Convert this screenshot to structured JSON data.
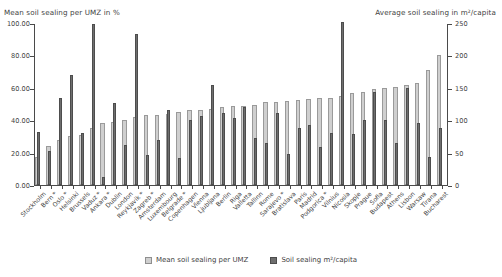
{
  "chart_data": {
    "type": "bar",
    "title": "",
    "left_axis": {
      "label": "Mean soil sealing per UMZ in %",
      "ticks": [
        "0.00",
        "20.00",
        "40.00",
        "60.00",
        "80.00",
        "100.00"
      ],
      "min": 0,
      "max": 100,
      "grid": false
    },
    "right_axis": {
      "label": "Average soil sealing in m²/capita",
      "ticks": [
        "0",
        "50",
        "100",
        "150",
        "200",
        "250"
      ],
      "min": 0,
      "max": 250,
      "grid": false
    },
    "legend": {
      "position": "bottom-center",
      "entries": [
        {
          "name": "Mean soil sealing per UMZ",
          "color": "#cfcfcf"
        },
        {
          "name": "Soil sealing m²/capita",
          "color": "#6e6e6e"
        }
      ]
    },
    "categories": [
      "Stockholm",
      "Bern *",
      "Oslo *",
      "Helsinki",
      "Brussels",
      "Vaduz *",
      "Ankara *",
      "Dublin",
      "London",
      "Reykjavik *",
      "Zagreb *",
      "Amsterdam",
      "Luxembourg",
      "Belgrade *",
      "Copenhagen",
      "Vienna",
      "Ljubljana",
      "Berlin",
      "Riga",
      "Valletta",
      "Tallinn",
      "Rome",
      "Sarajevo *",
      "Bratislava",
      "Paris",
      "Madrid",
      "Podgorica *",
      "Vilnius",
      "Nicosia",
      "Skopje",
      "Prague",
      "Sofia",
      "Budapest",
      "Athens",
      "Lisbon",
      "Warsaw",
      "Tirana",
      "Bucharest"
    ],
    "series": [
      {
        "name": "Mean soil sealing per UMZ",
        "unit": "%",
        "axis": "left",
        "color": "#cfcfcf",
        "values": [
          17.0,
          24.0,
          28.0,
          30.0,
          31.0,
          35.0,
          38.0,
          39.0,
          40.0,
          42.0,
          43.0,
          43.5,
          44.0,
          45.0,
          46.0,
          46.5,
          47.0,
          48.0,
          48.5,
          49.0,
          49.5,
          51.0,
          51.5,
          52.0,
          52.5,
          53.0,
          53.5,
          54.0,
          55.0,
          57.0,
          57.5,
          59.0,
          60.0,
          60.5,
          62.0,
          63.0,
          71.0,
          80.0
        ]
      },
      {
        "name": "Soil sealing m²/capita",
        "unit": "m²/capita",
        "axis": "right",
        "color": "#6e6e6e",
        "values": [
          82.0,
          53.0,
          135.0,
          170.0,
          80.0,
          248.0,
          13.0,
          127.0,
          62.0,
          233.0,
          46.0,
          70.0,
          115.0,
          41.0,
          100.0,
          107.0,
          155.0,
          111.0,
          104.0,
          120.0,
          72.0,
          65.0,
          111.0,
          48.0,
          88.0,
          92.0,
          59.0,
          80.0,
          252.0,
          78.0,
          100.0,
          143.0,
          100.0,
          65.0,
          150.0,
          96.0,
          43.0,
          88.0
        ]
      }
    ],
    "footnote": "* marks non-EU countries"
  }
}
